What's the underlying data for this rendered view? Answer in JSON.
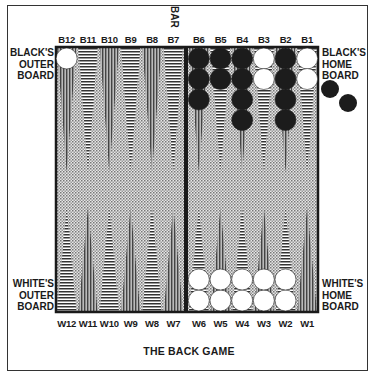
{
  "caption": "THE BACK GAME",
  "bar_label": "BAR",
  "zones": {
    "black_outer": [
      "BLACK'S",
      "OUTER",
      "BOARD"
    ],
    "black_home": [
      "BLACK'S",
      "HOME",
      "BOARD"
    ],
    "white_outer": [
      "WHITE'S",
      "OUTER",
      "BOARD"
    ],
    "white_home": [
      "WHITE'S",
      "HOME",
      "BOARD"
    ]
  },
  "top_points": [
    "B12",
    "B11",
    "B10",
    "B9",
    "B8",
    "B7",
    "B6",
    "B5",
    "B4",
    "B3",
    "B2",
    "B1"
  ],
  "bottom_points": [
    "W12",
    "W11",
    "W10",
    "W9",
    "W8",
    "W7",
    "W6",
    "W5",
    "W4",
    "W3",
    "W2",
    "W1"
  ],
  "checkers": {
    "top": [
      {
        "point": "B12",
        "color": "white",
        "count": 1
      },
      {
        "point": "B6",
        "color": "black",
        "count": 3
      },
      {
        "point": "B5",
        "color": "black",
        "count": 2
      },
      {
        "point": "B4",
        "color": "black",
        "count": 4
      },
      {
        "point": "B3",
        "color": "white",
        "count": 2
      },
      {
        "point": "B2",
        "color": "black",
        "count": 4
      },
      {
        "point": "B1",
        "color": "white",
        "count": 2
      }
    ],
    "bottom": [
      {
        "point": "W6",
        "color": "white",
        "count": 2
      },
      {
        "point": "W5",
        "color": "white",
        "count": 2
      },
      {
        "point": "W4",
        "color": "white",
        "count": 2
      },
      {
        "point": "W3",
        "color": "white",
        "count": 2
      },
      {
        "point": "W2",
        "color": "white",
        "count": 2
      }
    ],
    "borne_off": {
      "color": "black",
      "count": 2
    }
  },
  "colors": {
    "ink": "#1a1a1a",
    "board": "#d8d8d8",
    "white_checker": "#ffffff",
    "black_checker": "#1c1c1c"
  }
}
